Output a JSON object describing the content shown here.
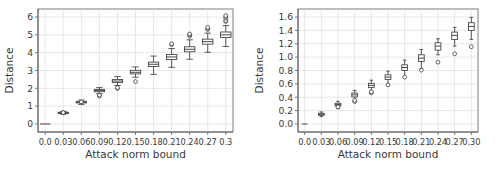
{
  "figure": {
    "width": 500,
    "height": 177,
    "panels": 2,
    "background": "#ffffff"
  },
  "chart_data": [
    {
      "type": "box",
      "panel": "left",
      "title": "",
      "xlabel": "Attack norm bound",
      "ylabel": "Distance",
      "grid": true,
      "legend": "none",
      "xlim": [
        -0.012,
        0.312
      ],
      "ylim": [
        -0.45,
        6.45
      ],
      "xticks": [
        0.0,
        0.03,
        0.06,
        0.09,
        0.12,
        0.15,
        0.18,
        0.21,
        0.24,
        0.27,
        0.3
      ],
      "xticklabels": [
        "0.0",
        "0.03",
        "0.06",
        "0.09",
        "0.12",
        "0.15",
        "0.18",
        "0.21",
        "0.24",
        "0.27",
        "0.3"
      ],
      "yticks": [
        0,
        1,
        2,
        3,
        4,
        5,
        6
      ],
      "yticklabels": [
        "0",
        "1",
        "2",
        "3",
        "4",
        "5",
        "6"
      ],
      "categories": [
        "0.0",
        "0.03",
        "0.06",
        "0.09",
        "0.12",
        "0.15",
        "0.18",
        "0.21",
        "0.24",
        "0.27",
        "0.3"
      ],
      "boxes": [
        {
          "x": 0.0,
          "whislo": 0.0,
          "q1": 0.0,
          "med": 0.0,
          "q3": 0.0,
          "whishi": 0.0,
          "fliers": []
        },
        {
          "x": 0.03,
          "whislo": 0.55,
          "q1": 0.6,
          "med": 0.63,
          "q3": 0.66,
          "whishi": 0.71,
          "fliers": [
            0.62,
            0.64
          ]
        },
        {
          "x": 0.06,
          "whislo": 1.1,
          "q1": 1.18,
          "med": 1.22,
          "q3": 1.27,
          "whishi": 1.34,
          "fliers": [
            1.24
          ]
        },
        {
          "x": 0.09,
          "whislo": 1.7,
          "q1": 1.81,
          "med": 1.87,
          "q3": 1.93,
          "whishi": 2.04,
          "fliers": [
            1.57,
            1.62
          ]
        },
        {
          "x": 0.12,
          "whislo": 2.16,
          "q1": 2.33,
          "med": 2.41,
          "q3": 2.5,
          "whishi": 2.66,
          "fliers": [
            1.99,
            2.04
          ]
        },
        {
          "x": 0.15,
          "whislo": 2.62,
          "q1": 2.81,
          "med": 2.9,
          "q3": 3.01,
          "whishi": 3.2,
          "fliers": [
            2.38
          ]
        },
        {
          "x": 0.18,
          "whislo": 2.78,
          "q1": 3.22,
          "med": 3.35,
          "q3": 3.47,
          "whishi": 3.81,
          "fliers": []
        },
        {
          "x": 0.21,
          "whislo": 3.18,
          "q1": 3.62,
          "med": 3.76,
          "q3": 3.9,
          "whishi": 4.23,
          "fliers": [
            4.45,
            4.5
          ]
        },
        {
          "x": 0.24,
          "whislo": 3.63,
          "q1": 4.05,
          "med": 4.19,
          "q3": 4.33,
          "whishi": 4.72,
          "fliers": [
            4.92,
            5.0,
            5.05
          ]
        },
        {
          "x": 0.27,
          "whislo": 4.02,
          "q1": 4.48,
          "med": 4.62,
          "q3": 4.76,
          "whishi": 5.1,
          "fliers": [
            5.3,
            5.36,
            5.42
          ]
        },
        {
          "x": 0.3,
          "whislo": 4.35,
          "q1": 4.85,
          "med": 5.0,
          "q3": 5.16,
          "whishi": 5.52,
          "fliers": [
            5.75,
            5.8,
            5.93,
            6.0,
            6.08
          ]
        }
      ]
    },
    {
      "type": "box",
      "panel": "right",
      "title": "",
      "xlabel": "Attack norm bound",
      "ylabel": "Distance",
      "grid": true,
      "legend": "none",
      "xlim": [
        -0.012,
        0.312
      ],
      "ylim": [
        -0.12,
        1.72
      ],
      "xticks": [
        0.0,
        0.03,
        0.06,
        0.09,
        0.12,
        0.15,
        0.18,
        0.21,
        0.24,
        0.27,
        0.3
      ],
      "xticklabels": [
        "0.0",
        "0.03",
        "0.06",
        "0.09",
        "0.12",
        "0.15",
        "0.18",
        "0.21",
        "0.24",
        "0.27",
        "0.30"
      ],
      "yticks": [
        0.0,
        0.2,
        0.4,
        0.6,
        0.8,
        1.0,
        1.2,
        1.4,
        1.6
      ],
      "yticklabels": [
        "0.0",
        "0.2",
        "0.4",
        "0.6",
        "0.8",
        "1.0",
        "1.2",
        "1.4",
        "1.6"
      ],
      "categories": [
        "0.0",
        "0.03",
        "0.06",
        "0.09",
        "0.12",
        "0.15",
        "0.18",
        "0.21",
        "0.24",
        "0.27",
        "0.30"
      ],
      "boxes": [
        {
          "x": 0.0,
          "whislo": 0.0,
          "q1": 0.0,
          "med": 0.0,
          "q3": 0.0,
          "whishi": 0.0,
          "fliers": []
        },
        {
          "x": 0.03,
          "whislo": 0.11,
          "q1": 0.13,
          "med": 0.145,
          "q3": 0.16,
          "whishi": 0.18,
          "fliers": []
        },
        {
          "x": 0.06,
          "whislo": 0.23,
          "q1": 0.27,
          "med": 0.29,
          "q3": 0.31,
          "whishi": 0.34,
          "fliers": [
            0.255
          ]
        },
        {
          "x": 0.09,
          "whislo": 0.345,
          "q1": 0.405,
          "med": 0.435,
          "q3": 0.462,
          "whishi": 0.5,
          "fliers": [
            0.335,
            0.355
          ]
        },
        {
          "x": 0.12,
          "whislo": 0.46,
          "q1": 0.545,
          "med": 0.578,
          "q3": 0.608,
          "whishi": 0.655,
          "fliers": [
            0.465,
            0.48
          ]
        },
        {
          "x": 0.15,
          "whislo": 0.585,
          "q1": 0.665,
          "med": 0.7,
          "q3": 0.735,
          "whishi": 0.79,
          "fliers": [
            0.585
          ]
        },
        {
          "x": 0.18,
          "whislo": 0.7,
          "q1": 0.8,
          "med": 0.845,
          "q3": 0.885,
          "whishi": 0.955,
          "fliers": [
            0.7
          ]
        },
        {
          "x": 0.21,
          "whislo": 0.825,
          "q1": 0.935,
          "med": 0.985,
          "q3": 1.035,
          "whishi": 1.115,
          "fliers": [
            0.805
          ]
        },
        {
          "x": 0.24,
          "whislo": 1.035,
          "q1": 1.105,
          "med": 1.165,
          "q3": 1.215,
          "whishi": 1.275,
          "fliers": [
            0.925
          ]
        },
        {
          "x": 0.27,
          "whislo": 1.165,
          "q1": 1.265,
          "med": 1.325,
          "q3": 1.375,
          "whishi": 1.445,
          "fliers": [
            1.05
          ]
        },
        {
          "x": 0.3,
          "whislo": 1.265,
          "q1": 1.4,
          "med": 1.46,
          "q3": 1.515,
          "whishi": 1.595,
          "fliers": [
            1.155
          ]
        }
      ]
    }
  ]
}
